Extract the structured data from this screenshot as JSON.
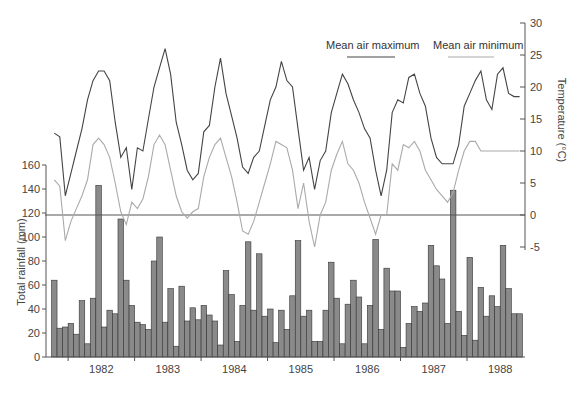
{
  "chart_data": {
    "type": "bar+line",
    "title": "",
    "xlabel": "",
    "x_tick_labels": [
      "1982",
      "1983",
      "1984",
      "1985",
      "1986",
      "1987",
      "1988"
    ],
    "months_start": "1981-10",
    "month_count": 85,
    "left_axis": {
      "label": "Total rainfall (mm)",
      "ticks": [
        0,
        20,
        40,
        60,
        80,
        100,
        120,
        140,
        160
      ],
      "range": [
        0,
        160
      ]
    },
    "right_axis": {
      "label": "Temperature (°C)",
      "ticks": [
        -5,
        0,
        5,
        10,
        15,
        20,
        25,
        30
      ],
      "range": [
        -5,
        30
      ]
    },
    "reference_line": {
      "temperature": 0,
      "rainfall": 120
    },
    "legend": [
      {
        "name": "Mean air maximum",
        "color": "#444444"
      },
      {
        "name": "Mean air minimum",
        "color": "#aaaaaa"
      }
    ],
    "series": [
      {
        "name": "Total rainfall",
        "type": "bar",
        "axis": "left",
        "color": "#8a8a8a",
        "values": [
          64,
          24,
          25,
          28,
          19,
          47,
          11,
          49,
          143,
          25,
          39,
          36,
          115,
          64,
          43,
          29,
          27,
          23,
          80,
          100,
          29,
          57,
          9,
          59,
          30,
          41,
          31,
          43,
          35,
          30,
          10,
          72,
          52,
          13,
          43,
          96,
          39,
          86,
          34,
          40,
          12,
          39,
          23,
          51,
          97,
          34,
          39,
          13,
          13,
          39,
          79,
          49,
          11,
          44,
          64,
          50,
          11,
          43,
          98,
          23,
          74,
          55,
          55,
          8,
          28,
          42,
          38,
          45,
          93,
          76,
          65,
          28,
          139,
          38,
          18,
          83,
          14,
          58,
          34,
          51,
          42,
          93,
          57,
          36,
          36
        ]
      },
      {
        "name": "Mean air maximum",
        "type": "line",
        "axis": "right",
        "color": "#444444",
        "values": [
          12.8,
          12.2,
          3.0,
          6.5,
          10.0,
          13.5,
          18.0,
          21.0,
          22.5,
          22.5,
          21.0,
          14.5,
          9.0,
          10.5,
          4.0,
          10.5,
          10.0,
          15.0,
          20.0,
          23.0,
          26.0,
          22.0,
          14.5,
          11.0,
          7.0,
          5.5,
          6.5,
          13.0,
          14.0,
          20.0,
          24.5,
          19.0,
          15.5,
          12.0,
          7.5,
          6.5,
          9.0,
          10.0,
          14.0,
          18.0,
          20.0,
          24.0,
          21.0,
          20.0,
          13.5,
          7.0,
          9.0,
          4.0,
          8.5,
          10.0,
          16.0,
          19.0,
          22.0,
          20.5,
          18.0,
          16.0,
          13.5,
          12.0,
          7.0,
          3.0,
          7.0,
          16.0,
          18.0,
          17.5,
          21.5,
          22.0,
          19.0,
          17.0,
          12.0,
          9.0,
          8.0,
          8.0,
          8.0,
          11.0,
          17.0,
          19.0,
          21.0,
          22.5,
          18.0,
          16.5,
          22.0,
          23.0,
          19.0,
          18.5,
          18.5
        ]
      },
      {
        "name": "Mean air minimum",
        "type": "line",
        "axis": "right",
        "color": "#aaaaaa",
        "values": [
          5.5,
          4.5,
          -4.0,
          -1.0,
          1.0,
          3.0,
          5.5,
          11.0,
          12.0,
          11.0,
          9.0,
          5.0,
          0.5,
          -1.5,
          2.0,
          1.0,
          2.5,
          6.0,
          11.0,
          12.5,
          11.0,
          7.0,
          3.0,
          0.5,
          -0.5,
          0.5,
          1.0,
          6.0,
          9.0,
          11.0,
          12.0,
          9.0,
          6.0,
          2.0,
          -2.5,
          -3.0,
          -1.0,
          2.0,
          5.0,
          8.0,
          11.5,
          11.0,
          10.5,
          7.0,
          1.0,
          5.0,
          -1.0,
          -5.0,
          0.0,
          2.0,
          7.0,
          9.5,
          11.5,
          8.0,
          7.0,
          5.0,
          2.0,
          -0.5,
          -3.0,
          0.0,
          0.0,
          8.0,
          7.0,
          11.0,
          10.5,
          11.5,
          10.0,
          7.0,
          5.5,
          4.0,
          3.0,
          2.0,
          3.5,
          7.0,
          10.0,
          11.5,
          11.5,
          10.0,
          10.0,
          10.0,
          10.0,
          10.0,
          10.0,
          10.0,
          10.0
        ]
      }
    ]
  }
}
